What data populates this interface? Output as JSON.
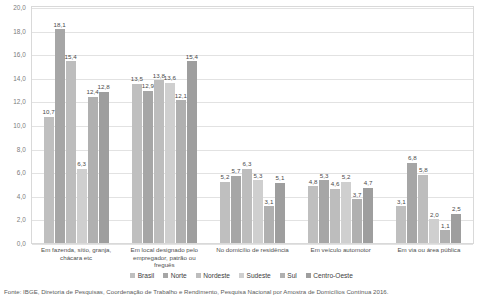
{
  "chart_data": {
    "type": "bar",
    "title": "",
    "subtitle": "",
    "xlabel": "",
    "ylabel": "",
    "ylim": [
      0.0,
      20.0
    ],
    "ytick_step": 2.0,
    "ytick_labels": [
      "0,0",
      "2,0",
      "4,0",
      "6,0",
      "8,0",
      "10,0",
      "12,0",
      "14,0",
      "16,0",
      "18,0",
      "20,0"
    ],
    "grid": true,
    "legend_position": "bottom",
    "decimal_separator": ",",
    "categories": [
      "Em fazenda, sítio, granja, chácara etc",
      "Em local designado pelo empregador, patrão ou freguês",
      "No domicílio de residência",
      "Em veículo automotor",
      "Em via ou área pública"
    ],
    "series": [
      {
        "name": "Brasil",
        "color": "#bfbfbf",
        "values": [
          10.7,
          13.5,
          5.2,
          4.8,
          3.1
        ],
        "labels": [
          "10,7",
          "13,5",
          "5,2",
          "4,8",
          "3,1"
        ]
      },
      {
        "name": "Norte",
        "color": "#a6a6a6",
        "values": [
          18.1,
          12.9,
          5.7,
          5.3,
          6.8
        ],
        "labels": [
          "18,1",
          "12,9",
          "5,7",
          "5,3",
          "6,8"
        ]
      },
      {
        "name": "Nordeste",
        "color": "#bdbdbd",
        "values": [
          15.4,
          13.8,
          6.3,
          4.6,
          5.8
        ],
        "labels": [
          "15,4",
          "13,8",
          "6,3",
          "4,6",
          "5,8"
        ]
      },
      {
        "name": "Sudeste",
        "color": "#cfcfcf",
        "values": [
          6.3,
          13.6,
          5.3,
          5.2,
          2.0
        ],
        "labels": [
          "6,3",
          "13,6",
          "5,3",
          "5,2",
          "2,0"
        ]
      },
      {
        "name": "Sul",
        "color": "#b0b0b0",
        "values": [
          12.4,
          12.1,
          3.1,
          3.7,
          1.1
        ],
        "labels": [
          "12,4",
          "12,1",
          "3,1",
          "3,7",
          "1,1"
        ]
      },
      {
        "name": "Centro-Oeste",
        "color": "#9e9e9e",
        "values": [
          12.8,
          15.4,
          5.1,
          4.7,
          2.5
        ],
        "labels": [
          "12,8",
          "15,4",
          "5,1",
          "4,7",
          "2,5"
        ]
      }
    ]
  },
  "source": {
    "text": "Fonte: IBGE, Diretoria de Pesquisas, Coordenação de Trabalho e Rendimento, Pesquisa Nacional por Amostra de Domicílios Contínua 2016."
  }
}
